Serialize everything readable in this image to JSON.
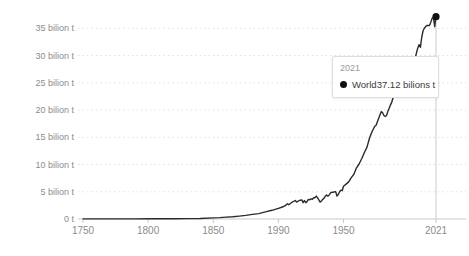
{
  "chart_data": {
    "type": "line",
    "title": "",
    "xlabel": "",
    "ylabel": "",
    "xlim": [
      1750,
      2021
    ],
    "ylim": [
      0,
      38
    ],
    "grid": "dotted-horizontal",
    "legend": "none",
    "y_ticks": [
      {
        "value": 0,
        "label": "0 t"
      },
      {
        "value": 5,
        "label": "5 bilion t"
      },
      {
        "value": 10,
        "label": "10 bilion t"
      },
      {
        "value": 15,
        "label": "15 bilion t"
      },
      {
        "value": 20,
        "label": "20 bilion t"
      },
      {
        "value": 25,
        "label": "25 bilion t"
      },
      {
        "value": 30,
        "label": "30 bilion t"
      },
      {
        "value": 35,
        "label": "35 bilion t"
      }
    ],
    "x_ticks": [
      {
        "year": 1750,
        "label": "1750"
      },
      {
        "year": 1800,
        "label": "1800"
      },
      {
        "year": 1850,
        "label": "1850"
      },
      {
        "year": 1900,
        "label": "1990"
      },
      {
        "year": 1950,
        "label": "1950"
      },
      {
        "year": 2021,
        "label": "2021"
      }
    ],
    "series": [
      {
        "name": "World",
        "points": [
          [
            1750,
            0.01
          ],
          [
            1760,
            0.011
          ],
          [
            1770,
            0.013
          ],
          [
            1780,
            0.016
          ],
          [
            1790,
            0.02
          ],
          [
            1800,
            0.03
          ],
          [
            1810,
            0.04
          ],
          [
            1820,
            0.05
          ],
          [
            1830,
            0.07
          ],
          [
            1840,
            0.1
          ],
          [
            1850,
            0.2
          ],
          [
            1855,
            0.26
          ],
          [
            1860,
            0.34
          ],
          [
            1865,
            0.42
          ],
          [
            1870,
            0.53
          ],
          [
            1875,
            0.66
          ],
          [
            1880,
            0.85
          ],
          [
            1885,
            1.0
          ],
          [
            1890,
            1.3
          ],
          [
            1895,
            1.6
          ],
          [
            1900,
            1.95
          ],
          [
            1903,
            2.2
          ],
          [
            1905,
            2.4
          ],
          [
            1907,
            2.8
          ],
          [
            1908,
            2.6
          ],
          [
            1910,
            3.0
          ],
          [
            1913,
            3.4
          ],
          [
            1914,
            3.1
          ],
          [
            1916,
            3.4
          ],
          [
            1918,
            3.5
          ],
          [
            1919,
            3.0
          ],
          [
            1920,
            3.4
          ],
          [
            1921,
            3.0
          ],
          [
            1922,
            3.2
          ],
          [
            1923,
            3.6
          ],
          [
            1924,
            3.5
          ],
          [
            1925,
            3.7
          ],
          [
            1926,
            3.6
          ],
          [
            1927,
            3.9
          ],
          [
            1928,
            3.9
          ],
          [
            1929,
            4.2
          ],
          [
            1930,
            3.9
          ],
          [
            1931,
            3.5
          ],
          [
            1932,
            3.1
          ],
          [
            1933,
            3.3
          ],
          [
            1934,
            3.6
          ],
          [
            1935,
            3.8
          ],
          [
            1936,
            4.2
          ],
          [
            1937,
            4.4
          ],
          [
            1938,
            4.2
          ],
          [
            1939,
            4.4
          ],
          [
            1940,
            4.8
          ],
          [
            1941,
            4.9
          ],
          [
            1942,
            4.9
          ],
          [
            1943,
            5.0
          ],
          [
            1944,
            5.0
          ],
          [
            1945,
            4.2
          ],
          [
            1946,
            4.5
          ],
          [
            1947,
            5.0
          ],
          [
            1948,
            5.3
          ],
          [
            1949,
            5.2
          ],
          [
            1950,
            6.0
          ],
          [
            1952,
            6.4
          ],
          [
            1954,
            6.8
          ],
          [
            1956,
            7.6
          ],
          [
            1958,
            8.2
          ],
          [
            1960,
            9.4
          ],
          [
            1962,
            10.1
          ],
          [
            1964,
            11.1
          ],
          [
            1966,
            12.2
          ],
          [
            1968,
            13.2
          ],
          [
            1970,
            14.9
          ],
          [
            1972,
            16.1
          ],
          [
            1974,
            17.0
          ],
          [
            1975,
            17.2
          ],
          [
            1977,
            18.5
          ],
          [
            1979,
            19.7
          ],
          [
            1980,
            19.5
          ],
          [
            1981,
            19.0
          ],
          [
            1982,
            18.8
          ],
          [
            1983,
            19.0
          ],
          [
            1984,
            19.7
          ],
          [
            1985,
            20.3
          ],
          [
            1986,
            20.9
          ],
          [
            1987,
            21.4
          ],
          [
            1988,
            22.2
          ],
          [
            1989,
            22.6
          ],
          [
            1990,
            22.7
          ],
          [
            1991,
            22.9
          ],
          [
            1992,
            22.6
          ],
          [
            1993,
            22.8
          ],
          [
            1994,
            23.1
          ],
          [
            1995,
            23.5
          ],
          [
            1996,
            24.1
          ],
          [
            1997,
            24.4
          ],
          [
            1998,
            24.3
          ],
          [
            1999,
            24.5
          ],
          [
            2000,
            25.5
          ],
          [
            2001,
            25.8
          ],
          [
            2002,
            26.1
          ],
          [
            2003,
            27.3
          ],
          [
            2004,
            28.4
          ],
          [
            2005,
            29.5
          ],
          [
            2006,
            30.5
          ],
          [
            2007,
            31.4
          ],
          [
            2008,
            32.0
          ],
          [
            2009,
            31.5
          ],
          [
            2010,
            33.3
          ],
          [
            2011,
            34.5
          ],
          [
            2012,
            35.0
          ],
          [
            2013,
            35.3
          ],
          [
            2014,
            35.5
          ],
          [
            2015,
            35.5
          ],
          [
            2016,
            35.5
          ],
          [
            2017,
            36.1
          ],
          [
            2018,
            36.8
          ],
          [
            2019,
            37.0
          ],
          [
            2020,
            35.3
          ],
          [
            2021,
            37.12
          ]
        ]
      }
    ],
    "end_marker": {
      "year": 2021,
      "value": 37.12
    },
    "colors": {
      "line": "#2b2b2b",
      "marker": "#111111",
      "grid": "#e1e1e1",
      "axis_line": "#c9c9c9",
      "tick_text": "#8c8c8c",
      "hover_line": "#cccccc"
    }
  },
  "tooltip": {
    "year": "2021",
    "series_label": "World",
    "value": "37.12 bilions t",
    "marker_icon": "circle",
    "colors": {
      "border": "#dedede",
      "bg": "#ffffff",
      "muted": "#999999",
      "text": "#3a3a3a"
    }
  }
}
